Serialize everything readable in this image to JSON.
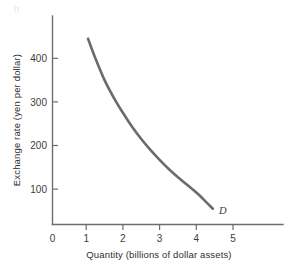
{
  "chart_data": {
    "type": "line",
    "title": "",
    "subtitle": "",
    "xlabel": "Quantity (billions of dollar assets)",
    "ylabel": "Exchange rate (yen per dollar)",
    "xlim": [
      0,
      6.3
    ],
    "ylim": [
      0,
      500
    ],
    "xticks": [
      0,
      1,
      2,
      3,
      4,
      5
    ],
    "xtick_labels": [
      "0",
      "1",
      "2",
      "3",
      "4",
      "5"
    ],
    "yticks": [
      100,
      200,
      300,
      400
    ],
    "ytick_labels": [
      "100",
      "200",
      "300",
      "400"
    ],
    "grid": false,
    "legend": "none",
    "series": [
      {
        "name": "D",
        "label": "D",
        "label_x": 4.62,
        "label_y": 42,
        "color": "#6b6b6b",
        "x": [
          1.05,
          1.25,
          1.5,
          1.75,
          2.0,
          2.25,
          2.5,
          2.75,
          3.0,
          3.25,
          3.5,
          3.75,
          4.0,
          4.25,
          4.45
        ],
        "y": [
          445,
          400,
          350,
          310,
          275,
          243,
          215,
          190,
          167,
          146,
          127,
          110,
          92,
          72,
          55
        ]
      }
    ],
    "annotations": [
      {
        "text": "D",
        "x": 4.62,
        "y": 42
      }
    ]
  },
  "axes": {
    "y_title": "Exchange rate (yen per dollar)",
    "x_title": "Quantity (billions of dollar assets)",
    "x_tick_labels": [
      "0",
      "1",
      "2",
      "3",
      "4",
      "5"
    ],
    "y_tick_labels": [
      "400",
      "300",
      "200",
      "100"
    ]
  },
  "artifact": {
    "mark": "b"
  }
}
